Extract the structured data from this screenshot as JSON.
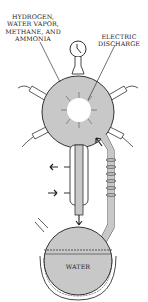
{
  "diagram": {
    "labels": {
      "gases": [
        "HYDROGEN,",
        "WATER VAPOR,",
        "METHANE, AND",
        "AMMONIA"
      ],
      "discharge": [
        "ELECTRIC",
        "DISCHARGE"
      ],
      "water": "WATER"
    },
    "colors": {
      "fill": "#c8c8c8",
      "stroke": "#333333",
      "background": "#ffffff"
    }
  }
}
